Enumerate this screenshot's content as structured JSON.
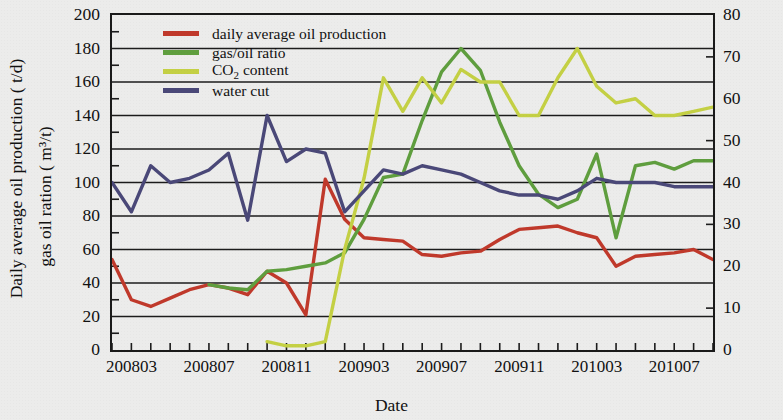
{
  "chart_data": {
    "type": "line",
    "title": "",
    "xlabel": "Date",
    "ylabel_left_line1": "Daily average oil production ( t/d)",
    "ylabel_left_line2": "gas oil ration ( m³/t)",
    "ylabel_right": "CO₂ content and water cut ( %)",
    "grid": true,
    "legend_position": "top-left-inside",
    "ylim_left": [
      0,
      200
    ],
    "ylim_right": [
      0,
      80
    ],
    "yticks_left": [
      0,
      20,
      40,
      60,
      80,
      100,
      120,
      140,
      160,
      180,
      200
    ],
    "yticks_right": [
      0,
      10,
      20,
      30,
      40,
      50,
      60,
      70,
      80
    ],
    "x": [
      "200802",
      "200803",
      "200804",
      "200805",
      "200806",
      "200807",
      "200808",
      "200809",
      "200810",
      "200811",
      "200812",
      "200901",
      "200902",
      "200903",
      "200904",
      "200905",
      "200906",
      "200907",
      "200908",
      "200909",
      "200910",
      "200911",
      "200912",
      "201001",
      "201002",
      "201003",
      "201004",
      "201005",
      "201006",
      "201007",
      "201008",
      "201009"
    ],
    "xtick_labels": [
      "200803",
      "200807",
      "200811",
      "200903",
      "200907",
      "200911",
      "201003",
      "201007"
    ],
    "xtick_label_positions": [
      1,
      5,
      9,
      13,
      17,
      21,
      25,
      29
    ],
    "series": [
      {
        "name": "daily average oil production",
        "axis": "left",
        "unit": "t/d",
        "color": "#c0392b",
        "x": [
          "200802",
          "200803",
          "200804",
          "200805",
          "200806",
          "200807",
          "200808",
          "200809",
          "200810",
          "200811",
          "200812",
          "200901",
          "200902",
          "200903",
          "200904",
          "200905",
          "200906",
          "200907",
          "200908",
          "200909",
          "200910",
          "200911",
          "200912",
          "201001",
          "201002",
          "201003",
          "201004",
          "201005",
          "201006",
          "201007",
          "201008",
          "201009"
        ],
        "values": [
          54,
          30,
          26,
          31,
          36,
          39,
          37,
          33,
          47,
          40,
          21,
          102,
          78,
          67,
          66,
          65,
          57,
          56,
          58,
          59,
          66,
          72,
          73,
          74,
          70,
          67,
          50,
          56,
          57,
          58,
          60,
          54
        ]
      },
      {
        "name": "gas/oil ratio",
        "axis": "left",
        "unit": "m³/t",
        "color": "#5f9e3e",
        "x": [
          "200807",
          "200808",
          "200809",
          "200810",
          "200811",
          "200812",
          "200901",
          "200902",
          "200903",
          "200904",
          "200905",
          "200906",
          "200907",
          "200908",
          "200909",
          "200910",
          "200911",
          "200912",
          "201001",
          "201002",
          "201003",
          "201004",
          "201005",
          "201006",
          "201007",
          "201008",
          "201009"
        ],
        "values": [
          39,
          37,
          36,
          47,
          48,
          50,
          52,
          58,
          78,
          103,
          105,
          137,
          166,
          180,
          167,
          136,
          110,
          93,
          85,
          90,
          117,
          67,
          110,
          112,
          108,
          113,
          113
        ]
      },
      {
        "name": "CO2 content",
        "axis": "right",
        "unit": "%",
        "color": "#c4d044",
        "x": [
          "200810",
          "200811",
          "200812",
          "200901",
          "200902",
          "200903",
          "200904",
          "200905",
          "200906",
          "200907",
          "200908",
          "200909",
          "200910",
          "200911",
          "200912",
          "201001",
          "201002",
          "201003",
          "201004",
          "201005",
          "201006",
          "201007",
          "201008",
          "201009"
        ],
        "values": [
          2,
          1,
          1,
          2,
          24,
          41,
          65,
          57,
          65,
          59,
          67,
          64,
          64,
          56,
          56,
          65,
          72,
          63,
          59,
          60,
          56,
          56,
          57,
          58
        ]
      },
      {
        "name": "water cut",
        "axis": "right",
        "unit": "%",
        "color": "#4a4878",
        "x": [
          "200802",
          "200803",
          "200804",
          "200805",
          "200806",
          "200807",
          "200808",
          "200809",
          "200810",
          "200811",
          "200812",
          "200901",
          "200902",
          "200903",
          "200904",
          "200905",
          "200906",
          "200907",
          "200908",
          "200909",
          "200910",
          "200911",
          "200912",
          "201001",
          "201002",
          "201003",
          "201004",
          "201005",
          "201006",
          "201007",
          "201008",
          "201009"
        ],
        "values": [
          40,
          33,
          44,
          40,
          41,
          43,
          47,
          31,
          56,
          45,
          48,
          47,
          33,
          38,
          43,
          42,
          44,
          43,
          42,
          40,
          38,
          37,
          37,
          36,
          38,
          41,
          40,
          40,
          40,
          39,
          39,
          39
        ]
      }
    ]
  },
  "legend": {
    "items": [
      {
        "label": "daily average oil production",
        "color": "#c0392b"
      },
      {
        "label": "gas/oil ratio",
        "color": "#5f9e3e"
      },
      {
        "label": "CO2 content",
        "color": "#c4d044",
        "html": "CO<sub>2</sub> content"
      },
      {
        "label": "water cut",
        "color": "#4a4878"
      }
    ]
  },
  "axes": {
    "x_title": "Date",
    "y_left_title_line1": "Daily average oil production ( t/d)",
    "y_left_title_line2": "gas oil ration ( m³/t)",
    "y_right_title": "CO₂ content and water cut ( %)"
  }
}
